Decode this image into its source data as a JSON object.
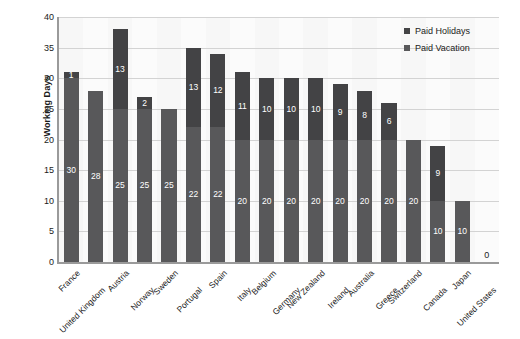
{
  "chart_data": {
    "type": "bar",
    "subtype": "stacked-bar",
    "title": "",
    "xlabel": "",
    "ylabel": "Working Days",
    "ylim": [
      0,
      40
    ],
    "yticks": [
      0,
      5,
      10,
      15,
      20,
      25,
      30,
      35,
      40
    ],
    "grid": true,
    "legend_position": "top-right",
    "categories": [
      "France",
      "United Kingdom",
      "Austria",
      "Norway",
      "Sweden",
      "Portugal",
      "Spain",
      "Italy",
      "Belgium",
      "Germany",
      "New Zealand",
      "Ireland",
      "Australia",
      "Greece",
      "Switzerland",
      "Canada",
      "Japan",
      "United States"
    ],
    "series": [
      {
        "name": "Paid Vacation",
        "color": "#58585a",
        "values": [
          30,
          28,
          25,
          25,
          25,
          22,
          22,
          20,
          20,
          20,
          20,
          20,
          20,
          20,
          20,
          10,
          10,
          0
        ]
      },
      {
        "name": "Paid Holidays",
        "color": "#434345",
        "values": [
          1,
          0,
          13,
          2,
          0,
          13,
          12,
          11,
          10,
          10,
          10,
          9,
          8,
          6,
          0,
          9,
          0,
          0
        ]
      }
    ],
    "totals": [
      31,
      28,
      38,
      27,
      25,
      35,
      34,
      31,
      30,
      30,
      30,
      29,
      28,
      26,
      20,
      19,
      10,
      0
    ],
    "annotations": [
      {
        "category": "United States",
        "text": "0"
      }
    ]
  },
  "legend": {
    "items": [
      {
        "label": "Paid Holidays",
        "color": "#434345"
      },
      {
        "label": "Paid Vacation",
        "color": "#58585a"
      }
    ]
  },
  "axis": {
    "y_title": "Working Days",
    "y_tick_labels": [
      "0",
      "5",
      "10",
      "15",
      "20",
      "25",
      "30",
      "35",
      "40"
    ]
  },
  "colors": {
    "plot_background": "#f7f7f7",
    "gridline": "#d3d3d3",
    "axis": "#9a9a9a",
    "text": "#1b1b1b",
    "holidays": "#434345",
    "vacation": "#58585a"
  }
}
